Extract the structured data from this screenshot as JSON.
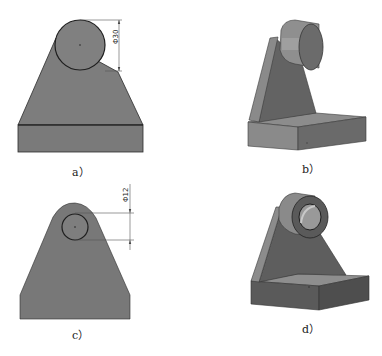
{
  "figures": [
    {
      "id": "a",
      "caption": "a）",
      "view": "front view with circle",
      "dimension": "Φ30"
    },
    {
      "id": "b",
      "caption": "b）",
      "view": "isometric solid with cylinder boss"
    },
    {
      "id": "c",
      "caption": "c）",
      "view": "front view with hole",
      "dimension": "Φ12"
    },
    {
      "id": "d",
      "caption": "d）",
      "view": "isometric solid with bored boss"
    }
  ],
  "colors": {
    "solid_fill": "#7d7d7d",
    "solid_dark": "#5f5f5f",
    "solid_light": "#9a9a9a",
    "outline": "#2b2b2b",
    "dim_line": "#555555"
  }
}
